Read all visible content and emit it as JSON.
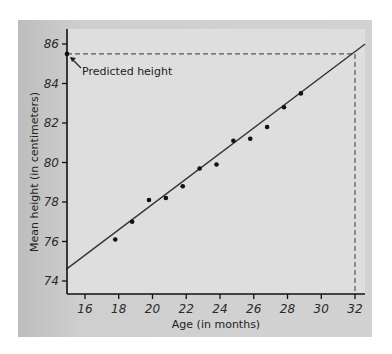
{
  "chart_data": {
    "type": "scatter",
    "title": "",
    "xlabel": "Age (in months)",
    "ylabel": "Mean height (in centimeters)",
    "xlim": [
      14.9,
      33
    ],
    "ylim": [
      73.3,
      86.7
    ],
    "x_ticks": [
      16,
      18,
      20,
      22,
      24,
      26,
      28,
      30,
      32
    ],
    "y_ticks": [
      74,
      76,
      78,
      80,
      82,
      84,
      86
    ],
    "x_tick_labels": [
      "16",
      "18",
      "20",
      "22",
      "24",
      "26",
      "28",
      "30",
      "32"
    ],
    "y_tick_labels": [
      "74",
      "76",
      "78",
      "80",
      "82",
      "84",
      "86"
    ],
    "grid": false,
    "legend": null,
    "series": [
      {
        "name": "Observed mean height",
        "x": [
          18,
          19,
          20,
          21,
          22,
          23,
          24,
          25,
          26,
          27,
          28,
          29
        ],
        "y": [
          76.1,
          77.0,
          78.1,
          78.2,
          78.8,
          79.7,
          79.9,
          81.1,
          81.2,
          81.8,
          82.8,
          83.5
        ]
      }
    ],
    "regression_line": {
      "x": [
        14.9,
        32.6
      ],
      "y": [
        74.6,
        86.0
      ],
      "slope": 0.635,
      "intercept": 65.1
    },
    "annotations": [
      {
        "text": "Predicted height",
        "target": {
          "x": 15,
          "y": 85.5
        },
        "guide_lines": "dashed horizontal at y=85.5 from y-axis to x=32; dashed vertical at x=32 down to x-axis"
      }
    ],
    "prediction": {
      "x": 32,
      "y": 85.5
    }
  },
  "labels": {
    "x_axis": "Age (in months)",
    "y_axis": "Mean height (in centimeters)",
    "annotation": "Predicted height"
  },
  "colors": {
    "panel": "#cccccc",
    "plot_area": "#dedede",
    "line": "#333333",
    "points": "#111111",
    "dashed": "#555555"
  }
}
